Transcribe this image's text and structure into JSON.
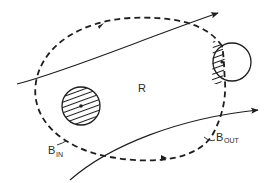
{
  "diagram": {
    "region_label": "R",
    "boundary_in": {
      "main": "B",
      "sub": "IN"
    },
    "boundary_out": {
      "main": "B",
      "sub": "OUT"
    },
    "elements": [
      {
        "name": "region-boundary",
        "style": "dashed closed curve",
        "arrows": 2
      },
      {
        "name": "streamline-top",
        "style": "solid arrow"
      },
      {
        "name": "streamline-bottom",
        "style": "solid arrow"
      },
      {
        "name": "interior-hatched-circle",
        "style": "fully hatched circle with center dot"
      },
      {
        "name": "boundary-circle",
        "style": "circle partially hatched inside region, center dot"
      }
    ]
  },
  "colors": {
    "stroke": "#1e1e1e",
    "background": "#ffffff"
  }
}
